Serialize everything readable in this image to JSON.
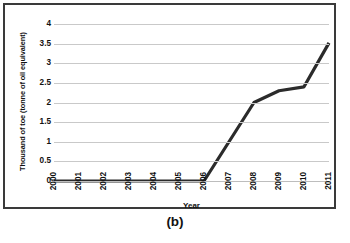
{
  "figure": {
    "caption": "(b)"
  },
  "chart_data": {
    "type": "line",
    "title": "",
    "xlabel": "Year",
    "ylabel": "Thousand of toe (tonne of oil equivalent)",
    "categories": [
      "2000",
      "2001",
      "2002",
      "2003",
      "2004",
      "2005",
      "2006",
      "2007",
      "2008",
      "2009",
      "2010",
      "2011"
    ],
    "values": [
      0,
      0,
      0,
      0,
      0,
      0,
      0,
      1.0,
      2.0,
      2.3,
      2.4,
      3.52
    ],
    "series": [
      {
        "name": "Thousand of toe",
        "values": [
          0,
          0,
          0,
          0,
          0,
          0,
          0,
          1.0,
          2.0,
          2.3,
          2.4,
          3.52
        ]
      }
    ],
    "ylim": [
      0,
      4
    ],
    "yticks": [
      "0",
      "0.5",
      "1",
      "1.5",
      "2",
      "2.5",
      "3",
      "3.5",
      "4"
    ],
    "ytick_values": [
      0,
      0.5,
      1,
      1.5,
      2,
      2.5,
      3,
      3.5,
      4
    ],
    "grid": true,
    "legend": "none",
    "line_color": "#2b2b2b",
    "gridline_color": "#c9c9c9",
    "border_color": "#3a3a3a",
    "background_color": "#ffffff"
  }
}
